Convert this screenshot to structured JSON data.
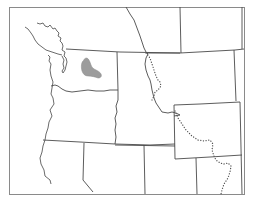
{
  "map": {
    "type": "range-map",
    "region": "Pacific Northwest, USA",
    "background_color": "#ffffff",
    "line_color": "#4a4a4a",
    "range_fill_color": "#9c9c9c",
    "layers": [
      {
        "name": "frame",
        "style": "solid"
      },
      {
        "name": "state-borders",
        "style": "solid"
      },
      {
        "name": "coastline",
        "style": "solid"
      },
      {
        "name": "continental-divide",
        "style": "dotted"
      },
      {
        "name": "species-range",
        "style": "filled-gray",
        "location": "northeastern Washington"
      }
    ],
    "regions_depicted": [
      "Washington",
      "Oregon",
      "Idaho",
      "Montana",
      "Wyoming",
      "Nevada",
      "Utah",
      "California",
      "British Columbia",
      "Alberta"
    ]
  }
}
